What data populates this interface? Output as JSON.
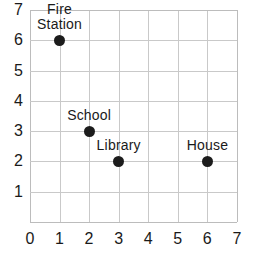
{
  "chart_data": {
    "type": "scatter",
    "title": "",
    "xlabel": "",
    "ylabel": "",
    "xlim": [
      0,
      7
    ],
    "ylim": [
      0,
      7
    ],
    "grid": true,
    "legend": "none",
    "x_tick_labels": [
      "0",
      "1",
      "2",
      "3",
      "4",
      "5",
      "6",
      "7"
    ],
    "y_tick_labels": [
      "1",
      "2",
      "3",
      "4",
      "5",
      "6",
      "7"
    ],
    "x_ticks": [
      0,
      1,
      2,
      3,
      4,
      5,
      6,
      7
    ],
    "y_ticks": [
      1,
      2,
      3,
      4,
      5,
      6,
      7
    ],
    "points": [
      {
        "label": "Fire Station",
        "label_lines": [
          "Fire",
          "Station"
        ],
        "x": 1,
        "y": 6,
        "two_line": true
      },
      {
        "label": "School",
        "label_lines": [
          "School"
        ],
        "x": 2,
        "y": 3,
        "two_line": false
      },
      {
        "label": "Library",
        "label_lines": [
          "Library"
        ],
        "x": 3,
        "y": 2,
        "two_line": false
      },
      {
        "label": "House",
        "label_lines": [
          "House"
        ],
        "x": 6,
        "y": 2,
        "two_line": false
      }
    ]
  },
  "colors": {
    "point": "#1c1c1c",
    "gridline": "#c9c9c9",
    "axis": "#bcbcbc",
    "text": "#1a1a1a",
    "background": "#ffffff"
  }
}
